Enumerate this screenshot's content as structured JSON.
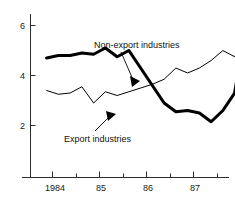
{
  "chart_data": {
    "type": "line",
    "title": "",
    "subtitle": "",
    "xlabel": "",
    "ylabel": "",
    "grid": false,
    "legend_position": "inline-annotations",
    "xlim": [
      1983.75,
      1988.0
    ],
    "ylim": [
      0,
      6.6
    ],
    "y_ticks": [
      2,
      4,
      6
    ],
    "y_tick_labels": [
      "2",
      "4",
      "6"
    ],
    "x_ticks": [
      1984,
      1985,
      1986,
      1987
    ],
    "x_tick_labels": [
      "1984",
      "85",
      "86",
      "87"
    ],
    "x_minor_ticks": [
      1984.5,
      1985.5,
      1986.5,
      1987.5
    ],
    "x": [
      1983.875,
      1984.125,
      1984.375,
      1984.625,
      1984.875,
      1985.125,
      1985.375,
      1985.625,
      1985.875,
      1986.125,
      1986.375,
      1986.625,
      1986.875,
      1987.125,
      1987.375,
      1987.625,
      1987.875
    ],
    "series": [
      {
        "name": "Export industries",
        "style": "thick",
        "values": [
          4.7,
          4.8,
          4.8,
          4.9,
          4.85,
          5.1,
          4.75,
          5.0,
          4.3,
          3.6,
          2.9,
          2.55,
          2.6,
          2.5,
          2.15,
          2.6,
          3.3
        ]
      },
      {
        "name": "Non-export industries",
        "style": "thin",
        "values": [
          3.4,
          3.25,
          3.3,
          3.55,
          2.9,
          3.35,
          3.2,
          3.35,
          3.5,
          3.65,
          3.85,
          4.3,
          4.1,
          4.3,
          4.6,
          5.0,
          4.75
        ]
      }
    ],
    "series_tail": {
      "Export industries": {
        "x": [
          1987.875,
          1988.0
        ],
        "values": [
          3.3,
          4.7
        ]
      },
      "Non-export industries": {
        "x": [
          1987.875,
          1988.0
        ],
        "values": [
          4.75,
          5.2
        ]
      }
    },
    "annotations": [
      {
        "name": "non-export-industries-label",
        "text": "Non-export industries",
        "anchor_x": 1985.9,
        "anchor_y": 3.95
      },
      {
        "name": "export-industries-label",
        "text": "Export industries",
        "anchor_x": 1985.75,
        "anchor_y": 2.62
      }
    ],
    "colors": {
      "line": "#000000",
      "axis": "#2b2b2b",
      "text": "#111111",
      "background": "#ffffff"
    }
  }
}
